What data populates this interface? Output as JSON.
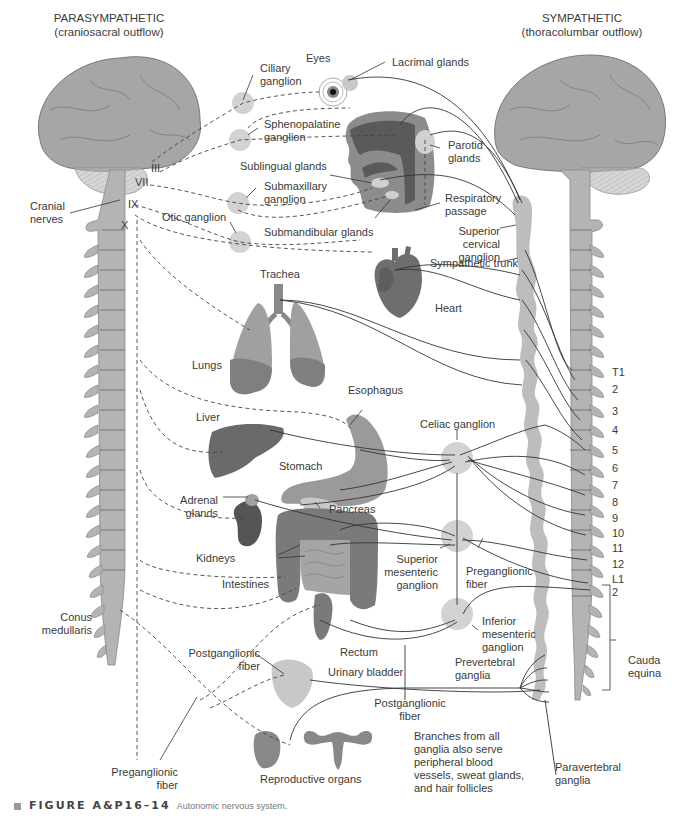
{
  "figure": {
    "caption_id": "FIGURE A&P16–14",
    "caption_text": "Autonomic nervous system."
  },
  "headers": {
    "parasympathetic_title": "PARASYMPATHETIC",
    "parasympathetic_sub": "(craniosacral outflow)",
    "sympathetic_title": "SYMPATHETIC",
    "sympathetic_sub": "(thoracolumbar outflow)"
  },
  "left_labels": {
    "cranial_nerves": "Cranial\nnerves",
    "nerve_iii": "III",
    "nerve_vii": "VII",
    "nerve_ix": "IX",
    "nerve_x": "X",
    "conus_medullaris": "Conus\nmedullaris",
    "preganglionic_fiber": "Preganglionic\nfiber"
  },
  "ganglia_labels": {
    "ciliary": "Ciliary\nganglion",
    "sphenopalatine": "Sphenopalatine\nganglion",
    "submaxillary": "Submaxillary\nganglion",
    "otic": "Otic ganglion",
    "celiac": "Celiac ganglion",
    "superior_mesenteric": "Superior\nmesenteric\nganglion",
    "inferior_mesenteric": "Inferior\nmesenteric\nganglion",
    "superior_cervical": "Superior\ncervical ganglion",
    "sympathetic_trunk": "Sympathetic trunk",
    "prevertebral": "Prevertebral\nganglia",
    "paravertebral": "Paravertebral\nganglia"
  },
  "organ_labels": {
    "eyes": "Eyes",
    "lacrimal_glands": "Lacrimal glands",
    "parotid_glands": "Parotid\nglands",
    "sublingual_glands": "Sublingual glands",
    "submandibular_glands": "Submandibular glands",
    "respiratory_passage": "Respiratory\npassage",
    "trachea": "Trachea",
    "heart": "Heart",
    "lungs": "Lungs",
    "esophagus": "Esophagus",
    "liver": "Liver",
    "stomach": "Stomach",
    "pancreas": "Pancreas",
    "adrenal_glands": "Adrenal\nglands",
    "kidneys": "Kidneys",
    "intestines": "Intestines",
    "rectum": "Rectum",
    "urinary_bladder": "Urinary bladder",
    "reproductive_organs": "Reproductive organs"
  },
  "fiber_labels": {
    "postganglionic_left": "Postganglionic\nfiber",
    "postganglionic_bottom": "Postganglionic\nfiber",
    "preganglionic_right": "Preganglionic\nfiber",
    "branches_note": "Branches from all\nganglia also serve\nperipheral blood\nvessels, sweat glands,\nand hair follicles"
  },
  "spinal_levels": [
    "T1",
    "2",
    "3",
    "4",
    "5",
    "6",
    "7",
    "8",
    "9",
    "10",
    "11",
    "12",
    "L1",
    "2"
  ],
  "cauda_equina": "Cauda\nequina",
  "colors": {
    "brain": "#a6a6a6",
    "spine": "#b4b4b4",
    "ganglion": "#d2d2d2",
    "organ_dark": "#6e6e6e",
    "organ_mid": "#8c8c8c",
    "organ_light": "#bdbdbd",
    "line": "#333333"
  }
}
